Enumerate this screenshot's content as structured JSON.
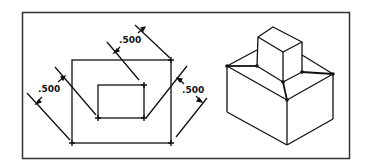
{
  "figure": {
    "left_view": {
      "title": "Plan view with offset rectangles",
      "dimensions": [
        {
          "label": ".500",
          "position": "top"
        },
        {
          "label": ".500",
          "position": "left"
        },
        {
          "label": ".500",
          "position": "right"
        }
      ]
    },
    "right_view": {
      "title": "Isometric view of box with smaller block on top"
    },
    "colors": {
      "line": "#111111",
      "frame": "#333333",
      "background": "#ffffff"
    }
  }
}
